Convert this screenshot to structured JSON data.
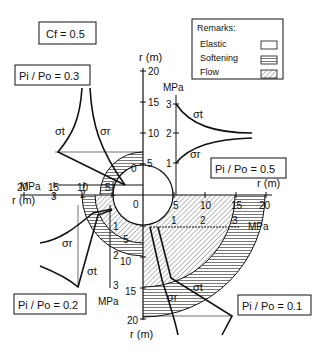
{
  "figure": {
    "cf_label": "Cf = 0.5",
    "legend": {
      "title": "Remarks:",
      "items": [
        {
          "label": "Elastic",
          "pattern": "blank"
        },
        {
          "label": "Softening",
          "pattern": "horizontal-hatch"
        },
        {
          "label": "Flow",
          "pattern": "diagonal-hatch"
        }
      ]
    },
    "quadrants": [
      {
        "position": "top-left",
        "label": "Pi / Po = 0.3",
        "stress_axis": "MPa",
        "stress_ticks": [
          "3",
          "2",
          "1"
        ]
      },
      {
        "position": "top-right",
        "label": "Pi / Po = 0.5",
        "stress_axis": "MPa",
        "stress_ticks": [
          "1",
          "2",
          "3"
        ]
      },
      {
        "position": "bottom-left",
        "label": "Pi / Po = 0.2",
        "stress_axis": "MPa",
        "stress_ticks": [
          "1",
          "2",
          "3"
        ]
      },
      {
        "position": "bottom-right",
        "label": "Pi / Po = 0.1",
        "stress_axis": "MPa",
        "stress_ticks": [
          "1",
          "2",
          "3"
        ]
      }
    ],
    "axes": {
      "r_label": "r (m)",
      "r_ticks": [
        "0",
        "5",
        "10",
        "15",
        "20"
      ]
    },
    "curve_labels": {
      "tangential": "σt",
      "radial": "σr"
    }
  }
}
